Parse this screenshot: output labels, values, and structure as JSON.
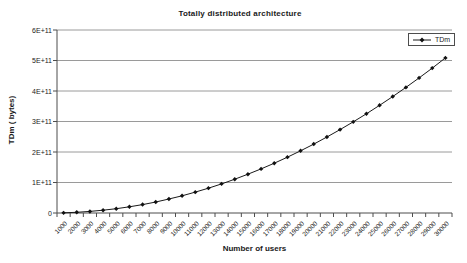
{
  "chart_data": {
    "type": "line",
    "title": "Totally distributed architecture",
    "xlabel": "Number of users",
    "ylabel": "TDm ( bytes)",
    "legend": {
      "position": "top-right",
      "entries": [
        "TDm"
      ]
    },
    "grid": "horizontal-only",
    "axis": {
      "ylim": [
        0,
        600000000000
      ],
      "y_tick_labels": [
        "0",
        "1E+11",
        "2E+11",
        "3E+11",
        "4E+11",
        "5E+11",
        "6E+11"
      ],
      "x_tick_interval": 1000
    },
    "categories": [
      1000,
      2000,
      3000,
      4000,
      5000,
      6000,
      7000,
      8000,
      9000,
      10000,
      11000,
      12000,
      13000,
      14000,
      15000,
      16000,
      17000,
      18000,
      19000,
      20000,
      21000,
      22000,
      23000,
      24000,
      25000,
      26000,
      27000,
      28000,
      29000,
      30000
    ],
    "series": [
      {
        "name": "TDm",
        "marker": "diamond",
        "color": "#1a1a1a",
        "values": [
          565000000,
          2260000000,
          5090000000,
          9040000000,
          14100000000,
          20300000000,
          27700000000,
          36200000000,
          45800000000,
          56500000000,
          68400000000,
          81400000000,
          95500000000,
          110700000000,
          127100000000,
          144600000000,
          163300000000,
          183100000000,
          204000000000,
          226000000000,
          249200000000,
          273500000000,
          298900000000,
          325400000000,
          353100000000,
          381900000000,
          411800000000,
          442900000000,
          475100000000,
          508500000000
        ]
      }
    ]
  },
  "colors": {
    "gridline": "#9a9a9a",
    "axis": "#4d4d4d",
    "text": "#1a1a1a",
    "series_line": "#1a1a1a",
    "marker_fill": "#111111",
    "background": "#ffffff"
  }
}
